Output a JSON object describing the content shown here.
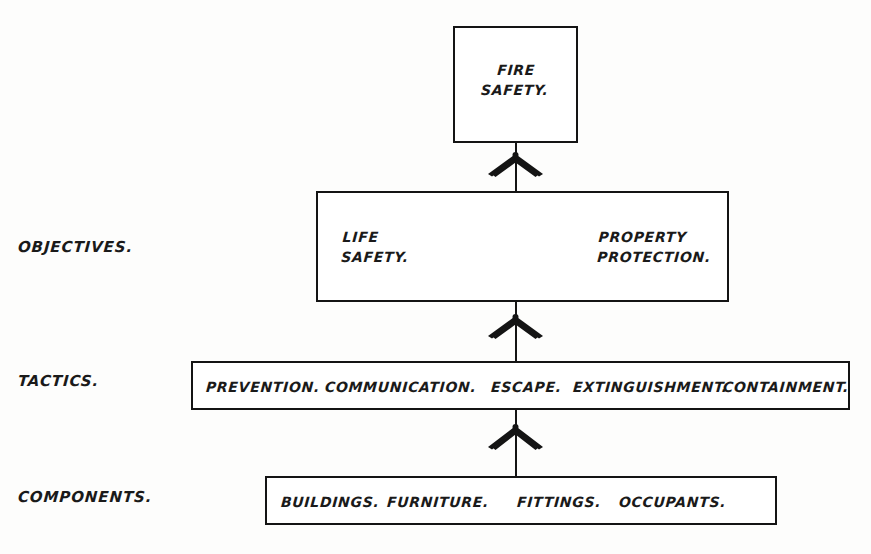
{
  "diagram": {
    "ink_color": "#141414",
    "background_color": "#fdfdfc",
    "root": {
      "line1": "FIRE",
      "line2": "SAFETY."
    },
    "rows": [
      {
        "label": "OBJECTIVES.",
        "items": [
          {
            "line1": "LIFE",
            "line2": "SAFETY."
          },
          {
            "line1": "PROPERTY",
            "line2": "PROTECTION."
          }
        ]
      },
      {
        "label": "TACTICS.",
        "items": [
          {
            "line1": "PREVENTION."
          },
          {
            "line1": "COMMUNICATION."
          },
          {
            "line1": "ESCAPE."
          },
          {
            "line1": "EXTINGUISHMENT."
          },
          {
            "line1": "CONTAINMENT."
          }
        ]
      },
      {
        "label": "COMPONENTS.",
        "items": [
          {
            "line1": "BUILDINGS."
          },
          {
            "line1": "FURNITURE."
          },
          {
            "line1": "FITTINGS."
          },
          {
            "line1": "OCCUPANTS."
          }
        ]
      }
    ],
    "connectors": [
      {
        "name": "root-to-objectives"
      },
      {
        "name": "objectives-to-tactics"
      },
      {
        "name": "tactics-to-components"
      }
    ]
  }
}
